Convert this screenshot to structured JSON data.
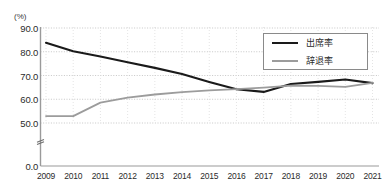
{
  "title_clipped": "",
  "unit_label": "(%)",
  "legend": {
    "position": "top-right",
    "items": [
      {
        "label": "出席率",
        "color": "#1a1a1a",
        "style": "solid-thick"
      },
      {
        "label": "辞退率",
        "color": "#9c9c9c",
        "style": "solid"
      }
    ]
  },
  "axis_break_symbol": "≈",
  "chart_data": {
    "type": "line",
    "title": "",
    "xlabel": "",
    "ylabel": "(%)",
    "categories": [
      "2009",
      "2010",
      "2011",
      "2012",
      "2013",
      "2014",
      "2015",
      "2016",
      "2017",
      "2018",
      "2019",
      "2020",
      "2021"
    ],
    "x": [
      2009,
      2010,
      2011,
      2012,
      2013,
      2014,
      2015,
      2016,
      2017,
      2018,
      2019,
      2020,
      2021
    ],
    "ylim": [
      0,
      90
    ],
    "y_ticks": [
      "0.0",
      "50.0",
      "60.0",
      "70.0",
      "80.0",
      "90.0"
    ],
    "y_tick_values": [
      0.0,
      50.0,
      60.0,
      70.0,
      80.0,
      90.0
    ],
    "y_axis_broken_between": [
      0.0,
      50.0
    ],
    "grid": true,
    "grid_style": "dotted",
    "legend_position": "top-right",
    "series": [
      {
        "name": "出席率",
        "color": "#1a1a1a",
        "values": [
          83.8,
          80.2,
          78.0,
          75.6,
          73.2,
          70.6,
          67.3,
          64.2,
          63.1,
          66.4,
          67.3,
          68.3,
          66.8
        ]
      },
      {
        "name": "辞退率",
        "color": "#9c9c9c",
        "values": [
          52.9,
          52.9,
          58.6,
          60.7,
          62.0,
          63.0,
          63.7,
          64.3,
          64.9,
          65.7,
          65.6,
          65.2,
          66.9
        ]
      }
    ]
  }
}
